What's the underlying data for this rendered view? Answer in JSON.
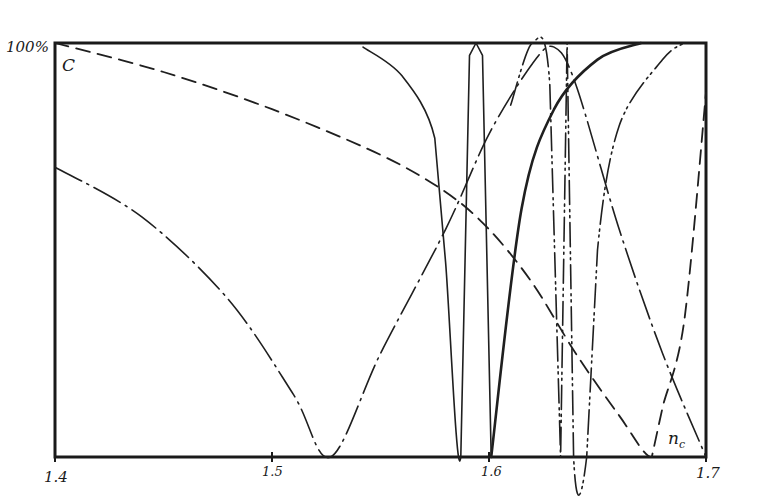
{
  "chart_data": {
    "type": "line",
    "title": "",
    "xlabel": "n_c",
    "ylabel": "C",
    "y_max_label": "100%",
    "xlim": [
      1.4,
      1.7
    ],
    "ylim": [
      0,
      100
    ],
    "x_ticks": [
      "1.4",
      "1.5",
      "1.6",
      "1.7"
    ],
    "grid": false,
    "legend": "none",
    "series": [
      {
        "name": "dashed",
        "style": "dashed",
        "points": [
          [
            1.4,
            100
          ],
          [
            1.45,
            93
          ],
          [
            1.5,
            84
          ],
          [
            1.55,
            73
          ],
          [
            1.58,
            64
          ],
          [
            1.6,
            55
          ],
          [
            1.62,
            42
          ],
          [
            1.64,
            25
          ],
          [
            1.66,
            10
          ],
          [
            1.675,
            0
          ],
          [
            1.68,
            12
          ],
          [
            1.69,
            33
          ],
          [
            1.7,
            88
          ]
        ]
      },
      {
        "name": "dash-dot",
        "style": "dash-dot",
        "points": [
          [
            1.4,
            70
          ],
          [
            1.44,
            58
          ],
          [
            1.48,
            38
          ],
          [
            1.51,
            15
          ],
          [
            1.527,
            0
          ],
          [
            1.55,
            25
          ],
          [
            1.58,
            55
          ],
          [
            1.6,
            78
          ],
          [
            1.62,
            95
          ],
          [
            1.63,
            99
          ],
          [
            1.64,
            90
          ],
          [
            1.66,
            55
          ],
          [
            1.68,
            25
          ],
          [
            1.7,
            0
          ]
        ]
      },
      {
        "name": "solid-thin",
        "style": "solid",
        "points": [
          [
            1.542,
            99
          ],
          [
            1.56,
            92
          ],
          [
            1.575,
            77
          ],
          [
            1.58,
            47
          ],
          [
            1.587,
            0
          ],
          [
            1.591,
            97
          ],
          [
            1.594,
            100
          ],
          [
            1.597,
            97
          ],
          [
            1.601,
            0
          ]
        ]
      },
      {
        "name": "solid-thick",
        "style": "solid-bold",
        "points": [
          [
            1.601,
            0
          ],
          [
            1.615,
            60
          ],
          [
            1.63,
            84
          ],
          [
            1.65,
            96
          ],
          [
            1.67,
            100
          ]
        ]
      },
      {
        "name": "dash-dot-dot",
        "style": "dash-dot-dot",
        "points": [
          [
            1.61,
            85
          ],
          [
            1.62,
            100
          ],
          [
            1.628,
            90
          ],
          [
            1.633,
            0
          ],
          [
            1.636,
            100
          ],
          [
            1.639,
            0
          ],
          [
            1.645,
            0
          ],
          [
            1.65,
            50
          ],
          [
            1.66,
            80
          ],
          [
            1.68,
            96
          ],
          [
            1.69,
            100
          ]
        ]
      }
    ]
  },
  "labels": {
    "y_max": "100%",
    "y_axis": "C",
    "x_axis": "n",
    "x_axis_sub": "c",
    "ticks": [
      "1.4",
      "1.5",
      "1.6",
      "1.7"
    ]
  }
}
